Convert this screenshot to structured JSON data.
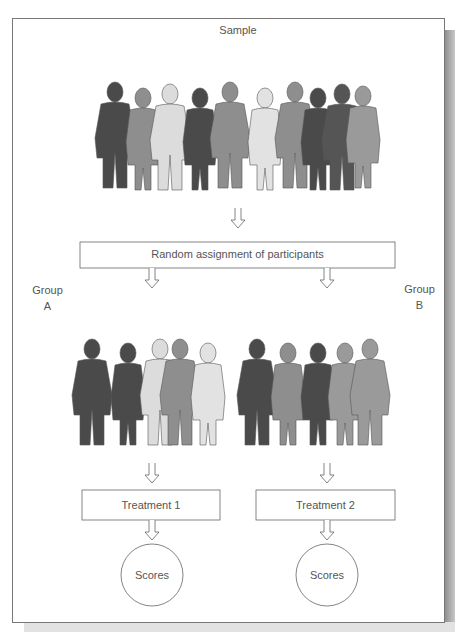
{
  "diagram": {
    "sample_label": "Sample",
    "assignment_label": "Random assignment of participants",
    "group_a": {
      "line1": "Group",
      "line2": "A",
      "treatment": "Treatment 1",
      "outcome": "Scores"
    },
    "group_b": {
      "line1": "Group",
      "line2": "B",
      "treatment": "Treatment 2",
      "outcome": "Scores"
    },
    "sample_size": 10,
    "group_a_size": 5,
    "group_b_size": 5
  }
}
